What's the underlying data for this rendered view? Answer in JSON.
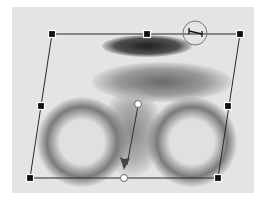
{
  "tool": "skew-transform",
  "canvas": {
    "background": "#e4e4e4",
    "subject": "blurred-cyclist"
  },
  "bounding_box": {
    "corners": [
      [
        52,
        34
      ],
      [
        240,
        34
      ],
      [
        218,
        178
      ],
      [
        30,
        178
      ]
    ],
    "side_handles": [
      [
        147,
        34
      ],
      [
        228,
        106
      ],
      [
        124,
        178
      ],
      [
        41,
        106
      ]
    ],
    "center": [
      138,
      104
    ],
    "line_color": "#2a2a2a"
  },
  "skew_cursor": {
    "x": 195,
    "y": 33,
    "radius": 12
  },
  "drag_arrow": {
    "from": [
      138,
      104
    ],
    "to": [
      124,
      176
    ]
  }
}
